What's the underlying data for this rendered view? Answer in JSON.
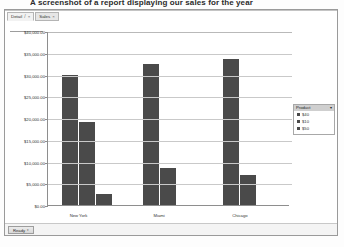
{
  "caption": "A screenshot of a report displaying our sales for the year",
  "tabs": [
    {
      "label": "Detail",
      "close": "×",
      "icon": "slash-icon",
      "active": true
    },
    {
      "label": "Sales",
      "close": "×",
      "active": false
    }
  ],
  "toolbar": {
    "chart_button": "Chart Area"
  },
  "legend": {
    "title": "Product",
    "expand_icon": "▾",
    "items": [
      {
        "label": "$40"
      },
      {
        "label": "$10"
      },
      {
        "label": "$50"
      }
    ]
  },
  "statusbar": {
    "button_label": "Ready",
    "caret": "▾"
  },
  "chart_data": {
    "type": "bar",
    "title": "",
    "xlabel": "",
    "ylabel": "",
    "categories": [
      "New York",
      "Miami",
      "Chicago"
    ],
    "ytick_labels": [
      "$40,000.00",
      "$35,000.00",
      "$30,000.00",
      "$25,000.00",
      "$20,000.00",
      "$15,000.00",
      "$10,000.00",
      "$5,000.00",
      "$0.00"
    ],
    "ytick_values": [
      40000,
      35000,
      30000,
      25000,
      20000,
      15000,
      10000,
      5000,
      0
    ],
    "ylim": [
      0,
      40000
    ],
    "grid": true,
    "legend_position": "right",
    "series": [
      {
        "name": "$40",
        "values": [
          30000,
          32500,
          33500
        ]
      },
      {
        "name": "$10",
        "values": [
          19000,
          8500,
          7000
        ]
      },
      {
        "name": "$50",
        "values": [
          2500,
          0,
          0
        ]
      }
    ]
  },
  "colors": {
    "bar": "#4a4a4a",
    "grid": "#c9c9c9",
    "axis": "#8e8e8e"
  }
}
